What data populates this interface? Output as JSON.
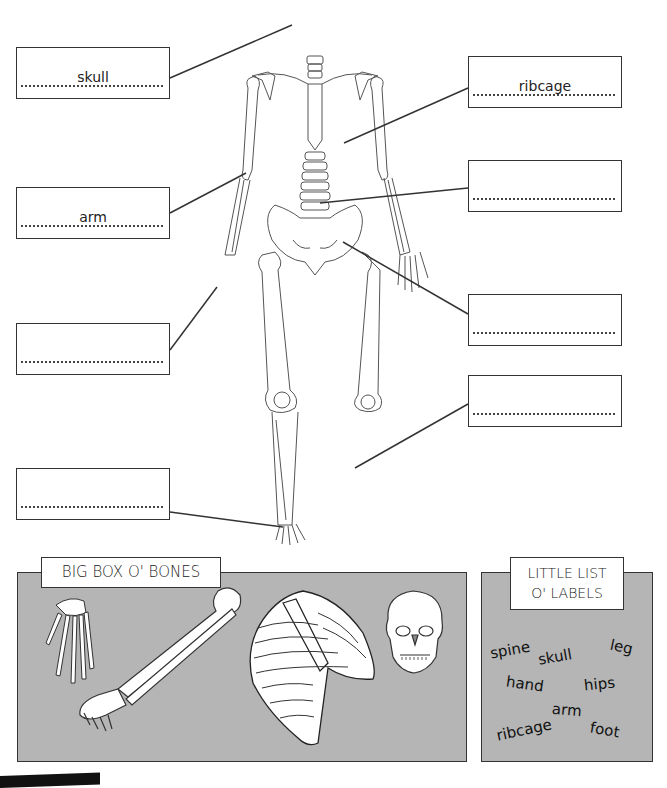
{
  "worksheet": {
    "skeleton_labels": {
      "left": [
        {
          "answer": "skull",
          "placeholder_dots": true
        },
        {
          "answer": "arm",
          "placeholder_dots": true
        },
        {
          "answer": "",
          "placeholder_dots": true
        },
        {
          "answer": "",
          "placeholder_dots": true
        }
      ],
      "right": [
        {
          "answer": "ribcage",
          "placeholder_dots": true
        },
        {
          "answer": "",
          "placeholder_dots": true
        },
        {
          "answer": "",
          "placeholder_dots": true
        },
        {
          "answer": "",
          "placeholder_dots": true
        }
      ]
    },
    "big_box": {
      "title": "BIG BOX O' BONES",
      "items": [
        "hand-bones",
        "arm-bones",
        "ribcage",
        "skull"
      ]
    },
    "little_list": {
      "title_line1": "LITTLE LIST",
      "title_line2": "O' LABELS",
      "words": [
        "spine",
        "skull",
        "leg",
        "hand",
        "hips",
        "arm",
        "ribcage",
        "foot"
      ]
    },
    "colors": {
      "panel_gray": "#b5b5b5",
      "line": "#333333"
    }
  }
}
